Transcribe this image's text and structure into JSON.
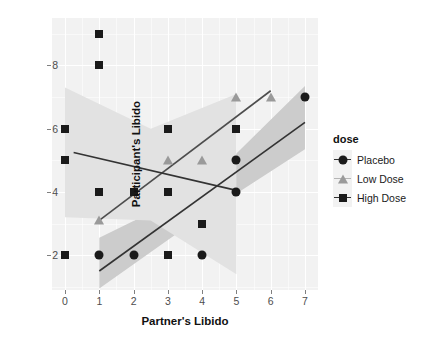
{
  "chart_data": {
    "type": "scatter",
    "title": "",
    "xlabel": "Partner's Libido",
    "ylabel": "Participant's Libido",
    "xlim": [
      -0.38,
      7.38
    ],
    "ylim": [
      0.9,
      9.5
    ],
    "xticks": [
      0,
      1,
      2,
      3,
      4,
      5,
      6,
      7
    ],
    "xticklabels": [
      "0",
      "1",
      "2",
      "3",
      "4",
      "5",
      "6",
      "7"
    ],
    "yticks": [
      2,
      4,
      6,
      8
    ],
    "yticklabels": [
      "2",
      "4",
      "6",
      "8"
    ],
    "grid": true,
    "grid_color": "#ffffff",
    "panel_background": "#f2f2f2",
    "legend": {
      "title": "dose",
      "position": "right",
      "entries": [
        {
          "label": "Placebo",
          "marker": "circle",
          "color": "#1a1a1a"
        },
        {
          "label": "Low Dose",
          "marker": "triangle",
          "color": "#9a9a9a"
        },
        {
          "label": "High Dose",
          "marker": "square",
          "color": "#1a1a1a"
        }
      ]
    },
    "series": [
      {
        "name": "Placebo",
        "marker": "circle",
        "color": "#1a1a1a",
        "points": [
          {
            "x": 1,
            "y": 2
          },
          {
            "x": 2,
            "y": 2
          },
          {
            "x": 4,
            "y": 2
          },
          {
            "x": 5,
            "y": 4
          },
          {
            "x": 5,
            "y": 5
          },
          {
            "x": 7,
            "y": 7
          }
        ],
        "fit_line": {
          "x0": 1,
          "y0": 1.5,
          "x1": 7,
          "y1": 6.2,
          "color": "#333333"
        },
        "confidence_band": {
          "x": [
            1,
            4,
            7
          ],
          "upper": [
            2.55,
            4.15,
            7.35
          ],
          "lower": [
            0.95,
            3.25,
            5.35
          ],
          "color": "#cccccc"
        }
      },
      {
        "name": "Low Dose",
        "marker": "triangle",
        "color": "#9a9a9a",
        "points": [
          {
            "x": 1,
            "y": 3.1
          },
          {
            "x": 3,
            "y": 5
          },
          {
            "x": 4,
            "y": 5
          },
          {
            "x": 5,
            "y": 7
          },
          {
            "x": 6,
            "y": 7
          }
        ],
        "fit_line": {
          "x0": 1,
          "y0": 3.1,
          "x1": 6,
          "y1": 7.2,
          "color": "#4d4d4d"
        },
        "confidence_band": null
      },
      {
        "name": "High Dose",
        "marker": "square",
        "color": "#1a1a1a",
        "points": [
          {
            "x": 0,
            "y": 6
          },
          {
            "x": 0,
            "y": 5
          },
          {
            "x": 0,
            "y": 2
          },
          {
            "x": 1,
            "y": 9
          },
          {
            "x": 1,
            "y": 8
          },
          {
            "x": 1,
            "y": 4
          },
          {
            "x": 2,
            "y": 4
          },
          {
            "x": 3,
            "y": 6
          },
          {
            "x": 3,
            "y": 4
          },
          {
            "x": 3,
            "y": 2
          },
          {
            "x": 4,
            "y": 3
          },
          {
            "x": 5,
            "y": 6
          }
        ],
        "fit_line": {
          "x0": 0.25,
          "y0": 5.25,
          "x1": 5,
          "y1": 4.05,
          "color": "#333333"
        },
        "confidence_band": {
          "x": [
            0,
            2.5,
            5
          ],
          "upper": [
            7.3,
            6.0,
            7.1
          ],
          "lower": [
            3.2,
            3.1,
            1.4
          ],
          "color": "#e2e2e2"
        }
      }
    ]
  }
}
